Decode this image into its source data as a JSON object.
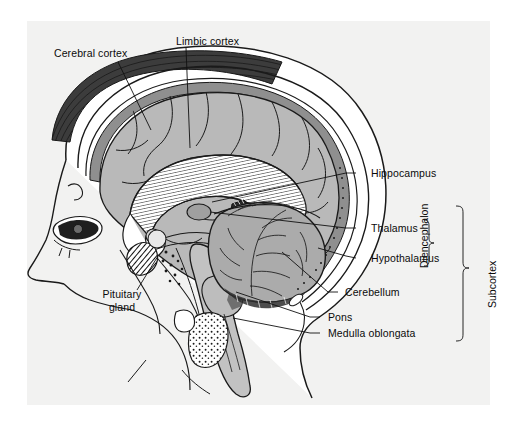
{
  "figure": {
    "type": "anatomical-diagram",
    "background_color": "#f2f2f1",
    "page_color": "#ffffff",
    "palette": {
      "outline": "#1a1a1a",
      "cortex_gray": "#b9b9b9",
      "meninges_gray": "#8f8f8f",
      "hair_dark": "#3a3a3a",
      "bone_white": "#fbfbfa",
      "cerebellum_gray": "#a9a9a9",
      "brainstem_gray": "#c2c2c2",
      "label_text": "#0b0b0b"
    }
  },
  "labels": {
    "cerebral_cortex": "Cerebral cortex",
    "limbic_cortex": "Limbic cortex",
    "hippocampus": "Hippocampus",
    "thalamus": "Thalamus",
    "hypothalamus": "Hypothalamus",
    "cerebellum": "Cerebellum",
    "pons": "Pons",
    "medulla_oblongata": "Medulla oblongata",
    "pituitary_gland": "Pituitary gland"
  },
  "brackets": {
    "diencephalon": "Diencephalon",
    "subcortex": "Subcortex"
  },
  "structures": [
    {
      "name": "Cerebral cortex",
      "region": "telencephalon",
      "side": "left-top"
    },
    {
      "name": "Limbic cortex",
      "region": "telencephalon",
      "side": "top-center"
    },
    {
      "name": "Hippocampus",
      "region": "limbic",
      "side": "right"
    },
    {
      "name": "Thalamus",
      "region": "diencephalon",
      "side": "right"
    },
    {
      "name": "Hypothalamus",
      "region": "diencephalon",
      "side": "right"
    },
    {
      "name": "Cerebellum",
      "region": "metencephalon",
      "side": "right"
    },
    {
      "name": "Pons",
      "region": "metencephalon",
      "side": "right"
    },
    {
      "name": "Medulla oblongata",
      "region": "myelencephalon",
      "side": "right"
    },
    {
      "name": "Pituitary gland",
      "region": "endocrine",
      "side": "left-bottom"
    }
  ],
  "groupings": [
    {
      "bracket": "Diencephalon",
      "members": [
        "Thalamus",
        "Hypothalamus"
      ]
    },
    {
      "bracket": "Subcortex",
      "members": [
        "Hippocampus",
        "Thalamus",
        "Hypothalamus",
        "Cerebellum",
        "Pons",
        "Medulla oblongata"
      ]
    }
  ]
}
